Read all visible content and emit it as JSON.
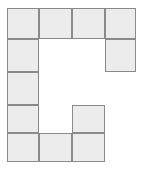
{
  "figure": {
    "name": "polyomino-grid-shape",
    "shape_letter": "C",
    "grid": {
      "columns": 4,
      "rows": 5,
      "origin_x": 7,
      "origin_y": 8,
      "column_edges": [
        7,
        39,
        72,
        105,
        136
      ],
      "row_edges": [
        8,
        39,
        72,
        105,
        133,
        162
      ],
      "cell_width": 32,
      "cell_height": 31
    },
    "style": {
      "fill_color": "#ececec",
      "border_color": "#8a8a8a",
      "background_color": "#ffffff",
      "border_width": "1.6px"
    },
    "filled_cells": [
      {
        "id": "cell-r1c1",
        "row": 1,
        "col": 1,
        "x": 7,
        "y": 8,
        "w": 32,
        "h": 31,
        "label": ""
      },
      {
        "id": "cell-r1c2",
        "row": 1,
        "col": 2,
        "x": 39,
        "y": 8,
        "w": 33,
        "h": 31,
        "label": ""
      },
      {
        "id": "cell-r1c3",
        "row": 1,
        "col": 3,
        "x": 72,
        "y": 8,
        "w": 33,
        "h": 31,
        "label": ""
      },
      {
        "id": "cell-r1c4",
        "row": 1,
        "col": 4,
        "x": 105,
        "y": 8,
        "w": 31,
        "h": 31,
        "label": ""
      },
      {
        "id": "cell-r2c1",
        "row": 2,
        "col": 1,
        "x": 7,
        "y": 39,
        "w": 32,
        "h": 33,
        "label": ""
      },
      {
        "id": "cell-r2c4",
        "row": 2,
        "col": 4,
        "x": 105,
        "y": 39,
        "w": 31,
        "h": 33,
        "label": ""
      },
      {
        "id": "cell-r3c1",
        "row": 3,
        "col": 1,
        "x": 7,
        "y": 72,
        "w": 32,
        "h": 33,
        "label": ""
      },
      {
        "id": "cell-r4c1",
        "row": 4,
        "col": 1,
        "x": 7,
        "y": 105,
        "w": 32,
        "h": 28,
        "label": ""
      },
      {
        "id": "cell-r4c3",
        "row": 4,
        "col": 3,
        "x": 72,
        "y": 105,
        "w": 33,
        "h": 28,
        "label": ""
      },
      {
        "id": "cell-r5c1",
        "row": 5,
        "col": 1,
        "x": 7,
        "y": 133,
        "w": 32,
        "h": 29,
        "label": ""
      },
      {
        "id": "cell-r5c2",
        "row": 5,
        "col": 2,
        "x": 39,
        "y": 133,
        "w": 33,
        "h": 29,
        "label": ""
      },
      {
        "id": "cell-r5c3",
        "row": 5,
        "col": 3,
        "x": 72,
        "y": 133,
        "w": 33,
        "h": 29,
        "label": ""
      }
    ],
    "cell_count": 12
  }
}
